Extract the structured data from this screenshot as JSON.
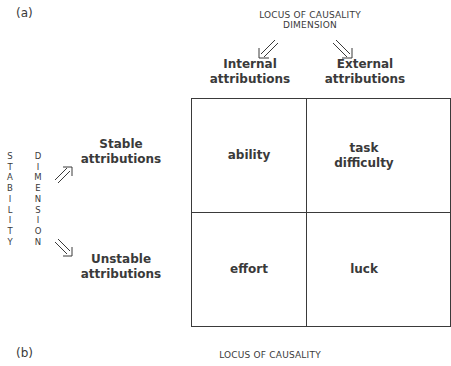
{
  "panel_a": {
    "label": "(a)",
    "locus_title_line1": "LOCUS OF CAUSALITY",
    "locus_title_line2": "DIMENSION",
    "internal_line1": "Internal",
    "internal_line2": "attributions",
    "external_line1": "External",
    "external_line2": "attributions",
    "stability_word": [
      "S",
      "T",
      "A",
      "B",
      "I",
      "L",
      "I",
      "T",
      "Y"
    ],
    "dimension_word": [
      "D",
      "I",
      "M",
      "E",
      "N",
      "S",
      "I",
      "O",
      "N"
    ],
    "stable_line1": "Stable",
    "stable_line2": "attributions",
    "unstable_line1": "Unstable",
    "unstable_line2": "attributions",
    "cells": {
      "stable_internal": "ability",
      "stable_external_line1": "task",
      "stable_external_line2": "difficulty",
      "unstable_internal": "effort",
      "unstable_external": "luck"
    }
  },
  "panel_b": {
    "label": "(b)",
    "locus_title": "LOCUS OF CAUSALITY"
  },
  "arrows": {
    "locus_to_internal": "double-arrow-down-left-icon",
    "locus_to_external": "double-arrow-down-right-icon",
    "stability_to_stable": "double-arrow-up-right-icon",
    "stability_to_unstable": "double-arrow-down-right-icon"
  }
}
